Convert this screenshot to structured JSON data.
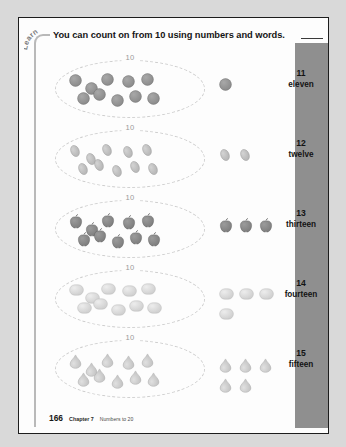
{
  "page": {
    "learn_label": "Learn",
    "heading": "You can count on from 10 using numbers and words.",
    "group_caption": "10"
  },
  "footer": {
    "page_number": "166",
    "chapter": "Chapter 7",
    "topic": "Numbers to 20"
  },
  "colors": {
    "paper": "#fdfdfd",
    "page_background": "#d9d9d9",
    "side_band": "#8f8f8f",
    "rule": "#b9b9b9",
    "ellipse_dash": "#cfcfcf",
    "text": "#131313"
  },
  "rows": [
    {
      "number": "11",
      "word": "eleven",
      "shape": "circle",
      "inside_count": 10,
      "outside_count": 1,
      "fill": "#8a8a8a"
    },
    {
      "number": "12",
      "word": "twelve",
      "shape": "oval",
      "inside_count": 10,
      "outside_count": 2,
      "fill": "#b5b5b5"
    },
    {
      "number": "13",
      "word": "thirteen",
      "shape": "apple",
      "inside_count": 10,
      "outside_count": 3,
      "fill": "#7d7d7d"
    },
    {
      "number": "14",
      "word": "fourteen",
      "shape": "rounded",
      "inside_count": 10,
      "outside_count": 4,
      "fill": "#cfcfcf"
    },
    {
      "number": "15",
      "word": "fifteen",
      "shape": "teardrop",
      "inside_count": 10,
      "outside_count": 5,
      "fill": "#c2c2c2"
    }
  ]
}
